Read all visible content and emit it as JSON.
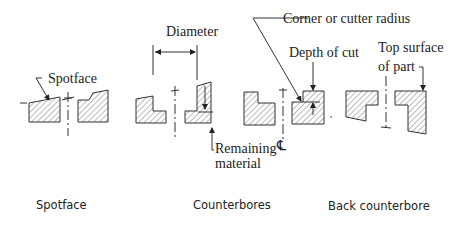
{
  "diagram": {
    "labels": {
      "spotface": "Spotface",
      "diameter": "Diameter",
      "corner_radius": "Corner or cutter radius",
      "depth_of_cut": "Depth of cut",
      "top_surface_line1": "Top surface",
      "top_surface_line2": "of part",
      "remaining_line1": "Remaining",
      "remaining_line2": "material",
      "centerline_symbol": "℄"
    },
    "captions": {
      "spotface": "Spotface",
      "counterbores": "Counterbores",
      "back_counterbore": "Back counterbore"
    }
  }
}
